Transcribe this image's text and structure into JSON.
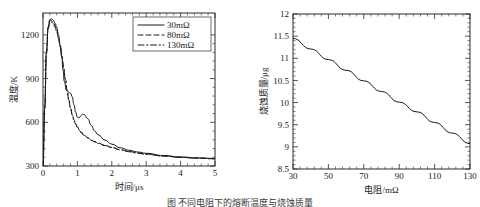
{
  "figure": {
    "caption_fragment": "图       不同电阻下的熔断温度与烧蚀质量"
  },
  "chart_data": [
    {
      "panel": "left",
      "type": "line",
      "title": "",
      "xlabel": "时间/μs",
      "ylabel": "温度/K",
      "xlim": [
        0,
        5
      ],
      "ylim": [
        300,
        1350
      ],
      "xticks": [
        0,
        1,
        2,
        3,
        4,
        5
      ],
      "yticks": [
        300,
        600,
        900,
        1200
      ],
      "xtick_labels": [
        "0",
        "1",
        "2",
        "3",
        "4",
        "5"
      ],
      "ytick_labels": [
        "300",
        "600",
        "900",
        "1200"
      ],
      "grid": false,
      "legend_position": "top-right",
      "series": [
        {
          "name": "30mΩ",
          "style": "solid",
          "x": [
            0,
            0.05,
            0.1,
            0.15,
            0.2,
            0.25,
            0.3,
            0.35,
            0.4,
            0.45,
            0.5,
            0.55,
            0.58,
            0.62,
            0.68,
            0.75,
            0.8,
            0.85,
            0.9,
            0.95,
            1.0,
            1.05,
            1.1,
            1.15,
            1.2,
            1.3,
            1.4,
            1.5,
            1.6,
            1.8,
            2.0,
            2.25,
            2.5,
            2.75,
            3.0,
            3.5,
            4.0,
            4.5,
            5.0
          ],
          "y": [
            300,
            700,
            1080,
            1250,
            1305,
            1310,
            1300,
            1280,
            1250,
            1200,
            1130,
            1040,
            960,
            880,
            820,
            805,
            800,
            775,
            720,
            670,
            635,
            630,
            645,
            655,
            652,
            625,
            580,
            540,
            515,
            478,
            450,
            425,
            408,
            396,
            387,
            372,
            362,
            356,
            352
          ]
        },
        {
          "name": "80mΩ",
          "style": "dashed",
          "x": [
            0,
            0.05,
            0.1,
            0.15,
            0.2,
            0.25,
            0.3,
            0.35,
            0.4,
            0.45,
            0.5,
            0.55,
            0.6,
            0.65,
            0.7,
            0.75,
            0.8,
            0.85,
            0.9,
            0.95,
            1.0,
            1.1,
            1.2,
            1.3,
            1.4,
            1.5,
            1.6,
            1.8,
            2.0,
            2.25,
            2.5,
            2.75,
            3.0,
            3.5,
            4.0,
            4.5,
            5.0
          ],
          "y": [
            300,
            700,
            1085,
            1255,
            1300,
            1298,
            1285,
            1262,
            1230,
            1185,
            1125,
            1055,
            975,
            895,
            820,
            755,
            700,
            655,
            618,
            590,
            568,
            535,
            512,
            495,
            480,
            468,
            458,
            442,
            428,
            412,
            400,
            390,
            382,
            369,
            360,
            354,
            350
          ]
        },
        {
          "name": "130mΩ",
          "style": "dashdot",
          "x": [
            0,
            0.05,
            0.1,
            0.15,
            0.2,
            0.25,
            0.3,
            0.35,
            0.4,
            0.45,
            0.5,
            0.55,
            0.6,
            0.65,
            0.7,
            0.75,
            0.8,
            0.85,
            0.9,
            0.95,
            1.0,
            1.1,
            1.2,
            1.3,
            1.4,
            1.5,
            1.6,
            1.8,
            2.0,
            2.25,
            2.5,
            2.75,
            3.0,
            3.5,
            4.0,
            4.5,
            5.0
          ],
          "y": [
            300,
            690,
            1070,
            1240,
            1288,
            1288,
            1275,
            1252,
            1220,
            1175,
            1118,
            1050,
            972,
            892,
            818,
            752,
            696,
            650,
            614,
            586,
            564,
            531,
            509,
            492,
            477,
            465,
            455,
            440,
            426,
            410,
            398,
            388,
            380,
            368,
            359,
            353,
            349
          ]
        }
      ]
    },
    {
      "panel": "right",
      "type": "line",
      "title": "",
      "xlabel": "电阻/mΩ",
      "ylabel": "烧蚀质量/μg",
      "xlim": [
        30,
        130
      ],
      "ylim": [
        8.5,
        12
      ],
      "xticks": [
        30,
        50,
        70,
        90,
        110,
        130
      ],
      "yticks": [
        8.5,
        9,
        9.5,
        10,
        10.5,
        11,
        11.5,
        12
      ],
      "xtick_labels": [
        "30",
        "50",
        "70",
        "90",
        "110",
        "130"
      ],
      "ytick_labels": [
        "8.5",
        "9",
        "9.5",
        "10",
        "10.5",
        "11",
        "11.5",
        "12"
      ],
      "grid": false,
      "legend_position": "none",
      "series": [
        {
          "name": "烧蚀质量",
          "style": "solid",
          "x": [
            30,
            40,
            50,
            60,
            70,
            80,
            90,
            100,
            110,
            120,
            130
          ],
          "y": [
            11.45,
            11.21,
            10.97,
            10.73,
            10.49,
            10.25,
            10.01,
            9.79,
            9.55,
            9.31,
            9.07
          ]
        }
      ]
    }
  ]
}
